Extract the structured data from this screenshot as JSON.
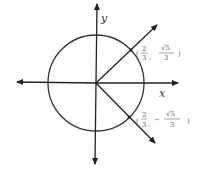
{
  "diagram": {
    "type": "unit-circle",
    "axes": {
      "x_label": "x",
      "y_label": "y"
    },
    "points": [
      {
        "open": "(",
        "x_num": "2",
        "x_den": "3",
        "sep": ",",
        "y_sign": "",
        "y_num": "√5",
        "y_den": "3",
        "close": ")"
      },
      {
        "open": "(",
        "x_num": "2",
        "x_den": "3",
        "sep": ",",
        "y_sign": "−",
        "y_num": "√5",
        "y_den": "3",
        "close": ")"
      }
    ],
    "colors": {
      "stroke": "#222222",
      "label": "#555555"
    }
  }
}
